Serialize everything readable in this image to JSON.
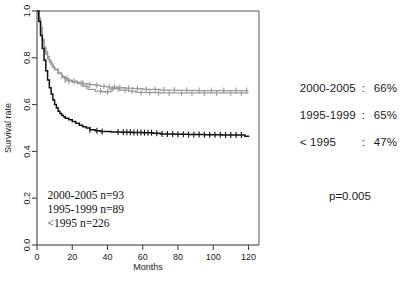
{
  "figure": {
    "kind": "kaplan-meier-survival-plot"
  },
  "chart_data": {
    "type": "line",
    "title": "",
    "xlabel": "Months",
    "ylabel": "Survival rate",
    "xlim": [
      0,
      126
    ],
    "ylim": [
      0,
      1.0
    ],
    "xticks": [
      0,
      20,
      40,
      60,
      80,
      100,
      120
    ],
    "xtick_labels": [
      "0",
      "20",
      "40",
      "60",
      "80",
      "100",
      "120"
    ],
    "yticks": [
      0.0,
      0.2,
      0.4,
      0.6,
      0.8,
      1.0
    ],
    "ytick_labels": [
      "0.0",
      "0.2",
      "0.4",
      "0.6",
      "0.8",
      "1.0"
    ],
    "grid": false,
    "legend_position": "right-outside",
    "series": [
      {
        "name": "2000-2005",
        "color": "#9a9a9a",
        "n": 93,
        "final_survival": 0.66,
        "points": [
          [
            0,
            1.0
          ],
          [
            1,
            0.97
          ],
          [
            2,
            0.93
          ],
          [
            3,
            0.88
          ],
          [
            4,
            0.845
          ],
          [
            5,
            0.825
          ],
          [
            6,
            0.805
          ],
          [
            7,
            0.79
          ],
          [
            8,
            0.775
          ],
          [
            9,
            0.762
          ],
          [
            10,
            0.752
          ],
          [
            12,
            0.735
          ],
          [
            14,
            0.722
          ],
          [
            15,
            0.715
          ],
          [
            16,
            0.705
          ],
          [
            18,
            0.7
          ],
          [
            20,
            0.695
          ],
          [
            24,
            0.692
          ],
          [
            27,
            0.688
          ],
          [
            30,
            0.685
          ],
          [
            33,
            0.682
          ],
          [
            36,
            0.678
          ],
          [
            40,
            0.675
          ],
          [
            45,
            0.672
          ],
          [
            50,
            0.67
          ],
          [
            55,
            0.668
          ],
          [
            60,
            0.665
          ],
          [
            70,
            0.662
          ],
          [
            80,
            0.661
          ],
          [
            90,
            0.66
          ],
          [
            105,
            0.66
          ],
          [
            120,
            0.66
          ]
        ],
        "censor_times": [
          14,
          16,
          18,
          26,
          30,
          34,
          38,
          41,
          44,
          47,
          52,
          57,
          62,
          67,
          72,
          78,
          85,
          92,
          99,
          106,
          113,
          119
        ]
      },
      {
        "name": "1995-1999",
        "color": "#9a9a9a",
        "n": 89,
        "final_survival": 0.65,
        "points": [
          [
            0,
            1.0
          ],
          [
            1,
            0.96
          ],
          [
            2,
            0.915
          ],
          [
            3,
            0.875
          ],
          [
            4,
            0.84
          ],
          [
            5,
            0.815
          ],
          [
            6,
            0.795
          ],
          [
            7,
            0.782
          ],
          [
            8,
            0.77
          ],
          [
            9,
            0.758
          ],
          [
            10,
            0.748
          ],
          [
            12,
            0.732
          ],
          [
            14,
            0.72
          ],
          [
            16,
            0.712
          ],
          [
            18,
            0.705
          ],
          [
            20,
            0.7
          ],
          [
            23,
            0.69
          ],
          [
            26,
            0.678
          ],
          [
            29,
            0.665
          ],
          [
            33,
            0.658
          ],
          [
            37,
            0.655
          ],
          [
            42,
            0.668
          ],
          [
            47,
            0.662
          ],
          [
            52,
            0.658
          ],
          [
            56,
            0.652
          ],
          [
            62,
            0.651
          ],
          [
            70,
            0.65
          ],
          [
            80,
            0.65
          ],
          [
            95,
            0.65
          ],
          [
            110,
            0.65
          ],
          [
            120,
            0.65
          ]
        ],
        "censor_times": [
          17,
          21,
          25,
          28,
          36,
          40,
          43,
          46,
          50,
          54,
          59,
          64,
          69,
          75,
          82,
          88,
          95,
          102,
          110,
          116
        ]
      },
      {
        "name": "< 1995",
        "color": "#111111",
        "n": 226,
        "final_survival": 0.47,
        "points": [
          [
            0,
            1.0
          ],
          [
            1,
            0.955
          ],
          [
            2,
            0.895
          ],
          [
            3,
            0.84
          ],
          [
            4,
            0.79
          ],
          [
            5,
            0.745
          ],
          [
            6,
            0.705
          ],
          [
            7,
            0.672
          ],
          [
            8,
            0.645
          ],
          [
            9,
            0.62
          ],
          [
            10,
            0.6
          ],
          [
            11,
            0.585
          ],
          [
            12,
            0.572
          ],
          [
            13,
            0.562
          ],
          [
            14,
            0.555
          ],
          [
            15,
            0.548
          ],
          [
            16,
            0.542
          ],
          [
            18,
            0.535
          ],
          [
            20,
            0.528
          ],
          [
            22,
            0.52
          ],
          [
            24,
            0.512
          ],
          [
            26,
            0.505
          ],
          [
            28,
            0.5
          ],
          [
            30,
            0.493
          ],
          [
            33,
            0.488
          ],
          [
            36,
            0.485
          ],
          [
            42,
            0.483
          ],
          [
            48,
            0.482
          ],
          [
            54,
            0.481
          ],
          [
            60,
            0.48
          ],
          [
            66,
            0.478
          ],
          [
            70,
            0.474
          ],
          [
            78,
            0.473
          ],
          [
            86,
            0.472
          ],
          [
            95,
            0.471
          ],
          [
            105,
            0.47
          ],
          [
            114,
            0.47
          ],
          [
            118,
            0.465
          ],
          [
            120,
            0.462
          ]
        ],
        "censor_times": [
          30,
          34,
          37,
          46,
          49,
          51,
          53,
          55,
          57,
          59,
          61,
          63,
          65,
          68,
          71,
          74,
          77,
          80,
          83,
          86,
          89,
          92,
          95,
          98,
          101,
          104,
          107,
          110,
          113,
          116
        ]
      }
    ],
    "annotations": [
      {
        "text": "2000-2005 n=93",
        "x": 6,
        "y": 0.195
      },
      {
        "text": "1995-1999 n=89",
        "x": 6,
        "y": 0.135
      },
      {
        "text": "<1995 n=226",
        "x": 6,
        "y": 0.075
      }
    ]
  },
  "legend": {
    "rows": [
      {
        "label": "2000-2005",
        "separator": ":",
        "value": "66%"
      },
      {
        "label": "1995-1999",
        "separator": ":",
        "value": "65%"
      },
      {
        "label": "< 1995",
        "separator": ":",
        "value": "47%"
      }
    ],
    "pvalue": "p=0.005"
  }
}
